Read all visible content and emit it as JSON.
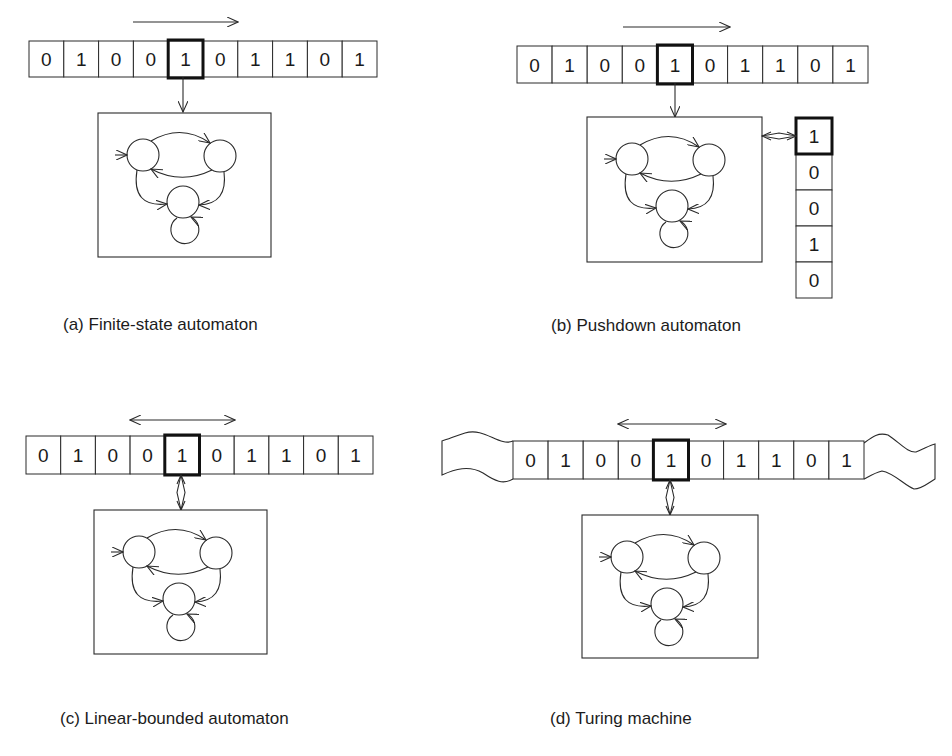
{
  "figure": {
    "stroke_color": "#2a2a2a",
    "background": "#ffffff",
    "tape_symbols": [
      "0",
      "1",
      "0",
      "0",
      "1",
      "0",
      "1",
      "1",
      "0",
      "1"
    ],
    "head_index": 4,
    "panels": [
      {
        "id": "a",
        "caption": "(a) Finite-state automaton",
        "caption_pos": [
          63,
          315
        ],
        "tape": {
          "x": 29,
          "y": 41,
          "cell_w": 34.8,
          "cell_h": 36
        },
        "motion_arrow": {
          "x1": 133,
          "x2": 238,
          "y": 22,
          "bidirectional": false
        },
        "head_link": {
          "type": "read",
          "x": 183,
          "y1": 77,
          "y2": 112
        },
        "control_box": {
          "x": 98,
          "y": 113,
          "w": 173,
          "h": 144
        },
        "wavy_ends": false,
        "stack": null
      },
      {
        "id": "b",
        "caption": "(b) Pushdown automaton",
        "caption_pos": [
          551,
          316
        ],
        "tape": {
          "x": 517,
          "y": 46,
          "cell_w": 35.1,
          "cell_h": 37
        },
        "motion_arrow": {
          "x1": 623,
          "x2": 730,
          "y": 27,
          "bidirectional": false
        },
        "head_link": {
          "type": "read",
          "x": 675,
          "y1": 83,
          "y2": 117
        },
        "control_box": {
          "x": 587,
          "y": 117,
          "w": 175,
          "h": 145
        },
        "wavy_ends": false,
        "stack": {
          "x": 796,
          "y": 118,
          "cell_w": 36,
          "cell_h": 36,
          "symbols": [
            "1",
            "0",
            "0",
            "1",
            "0"
          ],
          "top_index": 0,
          "link": {
            "x1": 762,
            "x2": 796,
            "y": 136
          }
        }
      },
      {
        "id": "c",
        "caption": "(c) Linear-bounded automaton",
        "caption_pos": [
          60,
          709
        ],
        "tape": {
          "x": 26,
          "y": 436,
          "cell_w": 34.7,
          "cell_h": 38
        },
        "motion_arrow": {
          "x1": 130,
          "x2": 235,
          "y": 420,
          "bidirectional": true
        },
        "head_link": {
          "type": "read-write",
          "x": 181,
          "y1": 475,
          "y2": 510
        },
        "control_box": {
          "x": 94,
          "y": 510,
          "w": 173,
          "h": 144
        },
        "wavy_ends": false,
        "stack": null
      },
      {
        "id": "d",
        "caption": "(d) Turing machine",
        "caption_pos": [
          550,
          709
        ],
        "tape": {
          "x": 513,
          "y": 441,
          "cell_w": 35.1,
          "cell_h": 38
        },
        "motion_arrow": {
          "x1": 618,
          "x2": 726,
          "y": 424,
          "bidirectional": true
        },
        "head_link": {
          "type": "read-write",
          "x": 670,
          "y1": 480,
          "y2": 515
        },
        "control_box": {
          "x": 582,
          "y": 515,
          "w": 176,
          "h": 143
        },
        "wavy_ends": true,
        "stack": null
      }
    ],
    "state_diagram": {
      "description": "three-state automaton with initial arrow, two arcs between top states, arcs to bottom state, and a self-loop",
      "states": [
        {
          "name": "left-state",
          "cx": 45,
          "cy": 42,
          "r": 16
        },
        {
          "name": "right-state",
          "cx": 122,
          "cy": 43,
          "r": 16
        },
        {
          "name": "bottom-state",
          "cx": 85,
          "cy": 89,
          "r": 16
        }
      ],
      "self_loop": {
        "cx": 85,
        "cy": 118,
        "r": 14
      }
    }
  }
}
